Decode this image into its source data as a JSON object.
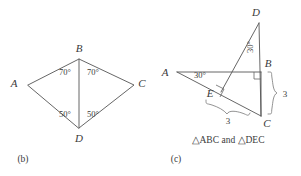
{
  "figure": {
    "panel_b": {
      "label": "(b)",
      "vertices": [
        {
          "name": "A",
          "label": "A",
          "x": 28,
          "y": 85,
          "label_x": 14,
          "label_y": 87
        },
        {
          "name": "B",
          "label": "B",
          "x": 79,
          "y": 59,
          "label_x": 75,
          "label_y": 51
        },
        {
          "name": "C",
          "label": "C",
          "x": 134,
          "y": 85,
          "label_x": 139,
          "label_y": 87
        },
        {
          "name": "D",
          "label": "D",
          "x": 79,
          "y": 128,
          "label_x": 75,
          "label_y": 141
        }
      ],
      "angles": [
        {
          "name": "angle-ABD",
          "value": "70°",
          "x": 56,
          "y": 73
        },
        {
          "name": "angle-DBC",
          "value": "70°",
          "x": 83,
          "y": 73
        },
        {
          "name": "angle-BDA",
          "value": "50°",
          "x": 56,
          "y": 117
        },
        {
          "name": "angle-BDC",
          "value": "50°",
          "x": 83,
          "y": 117
        }
      ]
    },
    "panel_c": {
      "label": "(c)",
      "caption": "△ABC and △DEC",
      "vertices": [
        {
          "name": "A",
          "label": "A",
          "x": 177,
          "y": 72,
          "label_x": 163,
          "label_y": 74
        },
        {
          "name": "B",
          "label": "B",
          "x": 261,
          "y": 72,
          "label_x": 265,
          "label_y": 66
        },
        {
          "name": "C",
          "label": "C",
          "x": 261,
          "y": 116,
          "label_x": 265,
          "label_y": 125
        },
        {
          "name": "D",
          "label": "D",
          "x": 259,
          "y": 23,
          "label_x": 254,
          "label_y": 16
        },
        {
          "name": "E",
          "label": "E",
          "x": 221,
          "y": 92,
          "label_x": 209,
          "label_y": 96
        }
      ],
      "angles": [
        {
          "name": "angle-at-A",
          "value": "30°",
          "x": 194,
          "y": 77,
          "rotation": 0
        },
        {
          "name": "angle-at-D",
          "value": "30°",
          "x": 253,
          "y": 48,
          "rotation": -90
        }
      ],
      "lengths": [
        {
          "name": "length-BC",
          "value": "3",
          "x": 284,
          "y": 97
        },
        {
          "name": "length-EC",
          "value": "3",
          "x": 228,
          "y": 122
        }
      ],
      "right_angles": [
        {
          "name": "right-angle-at-B",
          "x": 261,
          "y": 72
        },
        {
          "name": "right-angle-at-E",
          "x": 221,
          "y": 92
        }
      ]
    }
  },
  "colors": {
    "line": "#555555",
    "text": "#3a3a3a",
    "background": "#ffffff"
  }
}
